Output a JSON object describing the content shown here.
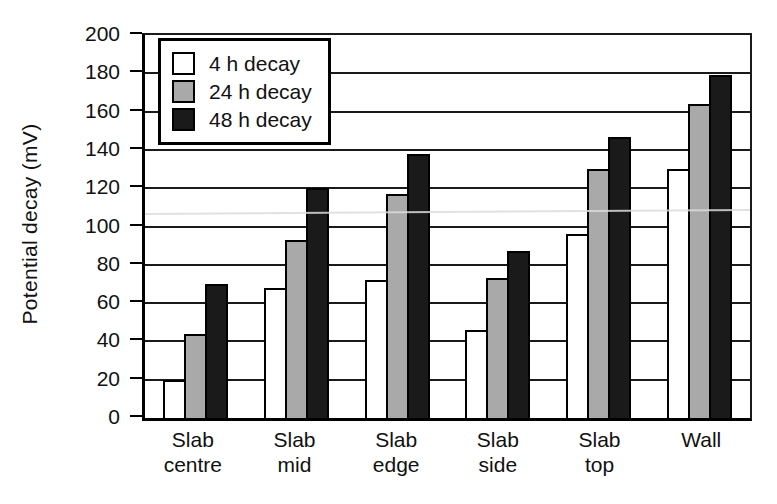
{
  "chart_data": {
    "type": "bar",
    "title": "",
    "xlabel": "",
    "ylabel": "Potential decay (mV)",
    "ylim": [
      0,
      200
    ],
    "yticks": [
      0,
      20,
      40,
      60,
      80,
      100,
      120,
      140,
      160,
      180,
      200
    ],
    "grid": true,
    "legend_position": "top-left inside plot",
    "categories": [
      "Slab centre",
      "Slab mid",
      "Slab edge",
      "Slab side",
      "Slab top",
      "Wall"
    ],
    "category_label_lines": [
      [
        "Slab",
        "centre"
      ],
      [
        "Slab",
        "mid"
      ],
      [
        "Slab",
        "edge"
      ],
      [
        "Slab",
        "side"
      ],
      [
        "Slab",
        "top"
      ],
      [
        "Wall"
      ]
    ],
    "series": [
      {
        "name": "4 h decay",
        "color": "#ffffff",
        "values": [
          20,
          68,
          72,
          46,
          96,
          130
        ]
      },
      {
        "name": "24 h decay",
        "color": "#a9a9a9",
        "values": [
          44,
          93,
          117,
          73,
          130,
          164
        ]
      },
      {
        "name": "48 h decay",
        "color": "#1a1a1a",
        "values": [
          70,
          120,
          138,
          87,
          147,
          179
        ]
      }
    ],
    "axis_color": "#000000",
    "gridline_color": "#1a1a1a"
  }
}
